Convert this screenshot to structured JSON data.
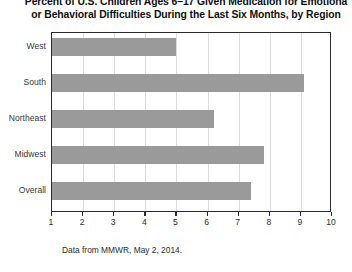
{
  "chart_data": {
    "type": "bar",
    "orientation": "horizontal",
    "title_lines": [
      "Percent of U.S. Children Ages 6–17 Given Medication for Emotiona",
      "or Behavioral Difficulties During the Last Six Months, by Region"
    ],
    "categories": [
      "West",
      "South",
      "Northeast",
      "Midwest",
      "Overall"
    ],
    "values": [
      5.0,
      9.1,
      6.2,
      7.8,
      7.4
    ],
    "xlabel": "",
    "ylabel": "",
    "xlim": [
      1,
      10
    ],
    "xticks": [
      1,
      2,
      3,
      4,
      5,
      6,
      7,
      8,
      9,
      10
    ],
    "xtick_labels": [
      "1",
      "2",
      "3",
      "4",
      "5",
      "6",
      "7",
      "8",
      "9",
      "10"
    ],
    "grid": true,
    "grid_axis": "x",
    "legend": false,
    "bar_color": "#9a9a9a",
    "frame_color": "#2b2b2b",
    "gridline_color": "#dcdcdc",
    "source_note": "Data from MMWR, May 2, 2014."
  }
}
